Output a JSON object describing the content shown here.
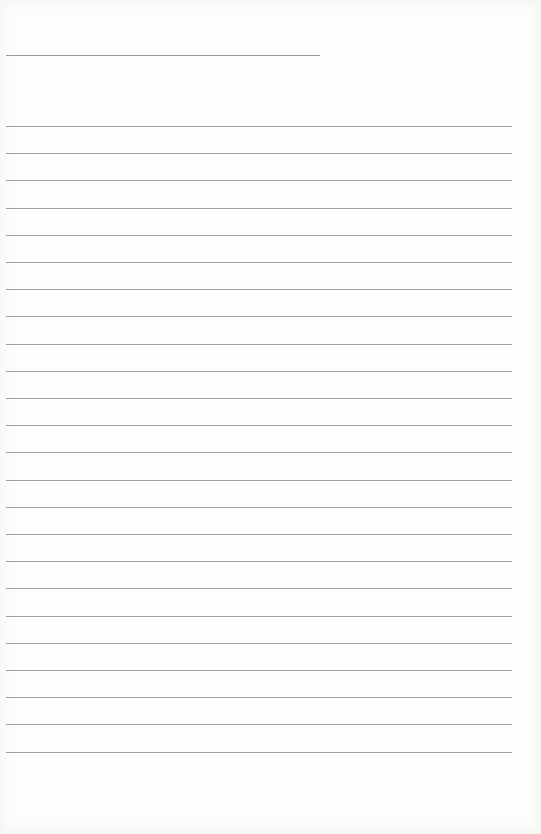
{
  "page": {
    "type": "lined notepaper",
    "background_color": "#fdfdfc",
    "line_color": "#a2a2a2",
    "title_line": {
      "x": 6,
      "y": 55,
      "width": 314,
      "text": ""
    },
    "ruled_lines": {
      "count": 24,
      "first_y": 126,
      "spacing": 27.2,
      "x": 6,
      "width": 506,
      "texts": [
        "",
        "",
        "",
        "",
        "",
        "",
        "",
        "",
        "",
        "",
        "",
        "",
        "",
        "",
        "",
        "",
        "",
        "",
        "",
        "",
        "",
        "",
        "",
        ""
      ]
    }
  }
}
